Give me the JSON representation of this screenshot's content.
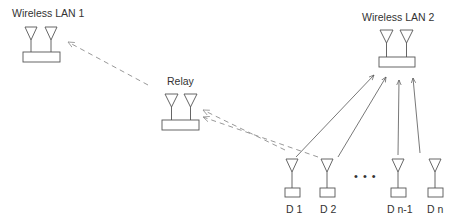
{
  "diagram": {
    "title": "",
    "colors": {
      "line": "#555555",
      "dashed": "#999999",
      "text": "#333333",
      "background": "#ffffff"
    },
    "nodes": {
      "wlan1": {
        "label": "Wireless LAN 1",
        "type": "access-point",
        "antennas": 2
      },
      "wlan2": {
        "label": "Wireless LAN 2",
        "type": "access-point",
        "antennas": 2
      },
      "relay": {
        "label": "Relay",
        "type": "relay",
        "antennas": 2
      },
      "d1": {
        "label": "D 1",
        "type": "device",
        "antennas": 1
      },
      "d2": {
        "label": "D 2",
        "type": "device",
        "antennas": 1
      },
      "dn1": {
        "label": "D n-1",
        "type": "device",
        "antennas": 1
      },
      "dn": {
        "label": "D n",
        "type": "device",
        "antennas": 1
      }
    },
    "ellipsis": "• • •",
    "edges": [
      {
        "from": "D 1",
        "to": "Wireless LAN 2",
        "style": "solid",
        "arrow": "to"
      },
      {
        "from": "D 2",
        "to": "Wireless LAN 2",
        "style": "solid",
        "arrow": "to"
      },
      {
        "from": "D n-1",
        "to": "Wireless LAN 2",
        "style": "solid",
        "arrow": "to"
      },
      {
        "from": "D n",
        "to": "Wireless LAN 2",
        "style": "solid",
        "arrow": "to"
      },
      {
        "from": "D 1",
        "to": "Relay",
        "style": "dashed",
        "arrow": "to"
      },
      {
        "from": "D 2",
        "to": "Relay",
        "style": "dashed",
        "arrow": "to"
      },
      {
        "from": "Relay",
        "to": "Wireless LAN 1",
        "style": "dashed",
        "arrow": "to"
      }
    ]
  }
}
